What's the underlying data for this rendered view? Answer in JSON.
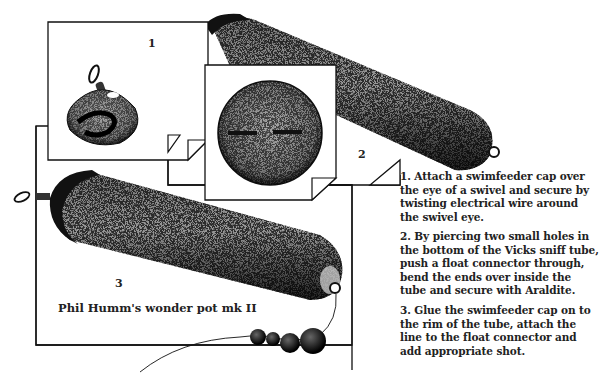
{
  "figure": {
    "title": "Phil Humm's wonder pot mk II",
    "panels": [
      {
        "number": "1",
        "subject": "swimfeeder cap attached to swivel eye"
      },
      {
        "number": "2",
        "subject": "bottom of Vicks sniff tube with float connector"
      },
      {
        "number": "3",
        "subject": "assembled wonder pot with line and shot"
      }
    ]
  },
  "instructions": [
    {
      "step": "1",
      "text": "1. Attach a swimfeeder cap over\nthe eye of a swivel and secure by\ntwisting electrical wire around\nthe swivel eye."
    },
    {
      "step": "2",
      "text": "2. By piercing two small holes in\nthe bottom of the Vicks sniff tube,\npush a float connector through,\nbend the ends over inside the\ntube and secure with Araldite."
    },
    {
      "step": "3",
      "text": "3. Glue the swimfeeder cap on to\nthe rim of the tube, attach the\nline to the float connector and\nadd appropriate shot."
    }
  ],
  "colors": {
    "ink": "#1a1a1a",
    "paper": "#ffffff"
  }
}
